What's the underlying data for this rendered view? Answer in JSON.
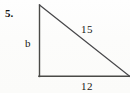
{
  "figure": {
    "problem_number": "5.",
    "type": "right-triangle",
    "labels": {
      "vertical_leg": "b",
      "hypotenuse": "15",
      "base": "12"
    },
    "colors": {
      "background": "#fdfdfc",
      "stroke": "#3a3a38",
      "text": "#1a1713"
    },
    "geometry": {
      "apex": [
        39,
        5
      ],
      "right_angle_vertex": [
        39,
        76
      ],
      "far_vertex": [
        130,
        76
      ],
      "right_angle_at": "bottom-left"
    }
  }
}
